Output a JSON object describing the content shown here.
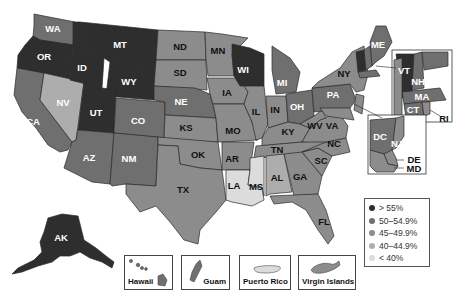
{
  "map": {
    "type": "choropleth",
    "region": "United States",
    "legend": {
      "items": [
        {
          "label": "> 55%",
          "color": "#2e2e2e"
        },
        {
          "label": "50–54.9%",
          "color": "#6f6f6f"
        },
        {
          "label": "45–49.9%",
          "color": "#8c8c8c"
        },
        {
          "label": "40–44.9%",
          "color": "#adadad"
        },
        {
          "label": "< 40%",
          "color": "#dcdcdc"
        }
      ]
    },
    "states": {
      "WA": {
        "label": "WA",
        "bin": "50–54.9%"
      },
      "OR": {
        "label": "OR",
        "bin": "> 55%"
      },
      "CA": {
        "label": "CA",
        "bin": "50–54.9%"
      },
      "NV": {
        "label": "NV",
        "bin": "40–44.9%"
      },
      "ID": {
        "label": "ID",
        "bin": "> 55%"
      },
      "MT": {
        "label": "MT",
        "bin": "> 55%"
      },
      "WY": {
        "label": "WY",
        "bin": "> 55%"
      },
      "UT": {
        "label": "UT",
        "bin": "> 55%"
      },
      "AZ": {
        "label": "AZ",
        "bin": "50–54.9%"
      },
      "CO": {
        "label": "CO",
        "bin": "50–54.9%"
      },
      "NM": {
        "label": "NM",
        "bin": "50–54.9%"
      },
      "ND": {
        "label": "ND",
        "bin": "45–49.9%"
      },
      "SD": {
        "label": "SD",
        "bin": "45–49.9%"
      },
      "NE": {
        "label": "NE",
        "bin": "50–54.9%"
      },
      "KS": {
        "label": "KS",
        "bin": "45–49.9%"
      },
      "OK": {
        "label": "OK",
        "bin": "45–49.9%"
      },
      "TX": {
        "label": "TX",
        "bin": "45–49.9%"
      },
      "MN": {
        "label": "MN",
        "bin": "45–49.9%"
      },
      "IA": {
        "label": "IA",
        "bin": "45–49.9%"
      },
      "MO": {
        "label": "MO",
        "bin": "45–49.9%"
      },
      "AR": {
        "label": "AR",
        "bin": "45–49.9%"
      },
      "LA": {
        "label": "LA",
        "bin": "< 40%"
      },
      "WI": {
        "label": "WI",
        "bin": "> 55%"
      },
      "IL": {
        "label": "IL",
        "bin": "45–49.9%"
      },
      "MI": {
        "label": "MI",
        "bin": "50–54.9%"
      },
      "IN": {
        "label": "IN",
        "bin": "45–49.9%"
      },
      "OH": {
        "label": "OH",
        "bin": "50–54.9%"
      },
      "KY": {
        "label": "KY",
        "bin": "45–49.9%"
      },
      "TN": {
        "label": "TN",
        "bin": "45–49.9%"
      },
      "MS": {
        "label": "MS",
        "bin": "< 40%"
      },
      "AL": {
        "label": "AL",
        "bin": "40–44.9%"
      },
      "GA": {
        "label": "GA",
        "bin": "45–49.9%"
      },
      "FL": {
        "label": "FL",
        "bin": "45–49.9%"
      },
      "SC": {
        "label": "SC",
        "bin": "45–49.9%"
      },
      "NC": {
        "label": "NC",
        "bin": "45–49.9%"
      },
      "VA": {
        "label": "VA",
        "bin": "45–49.9%"
      },
      "WV": {
        "label": "WV",
        "bin": "45–49.9%"
      },
      "PA": {
        "label": "PA",
        "bin": "50–54.9%"
      },
      "NY": {
        "label": "NY",
        "bin": "45–49.9%"
      },
      "VT": {
        "label": "VT",
        "bin": "> 55%"
      },
      "NH": {
        "label": "NH",
        "bin": "50–54.9%"
      },
      "ME": {
        "label": "ME",
        "bin": "50–54.9%"
      },
      "MA": {
        "label": "MA",
        "bin": "50–54.9%"
      },
      "CT": {
        "label": "CT",
        "bin": "50–54.9%"
      },
      "RI": {
        "label": "RI",
        "bin": "45–49.9%"
      },
      "NJ": {
        "label": "NJ",
        "bin": "45–49.9%"
      },
      "DE": {
        "label": "DE",
        "bin": "45–49.9%"
      },
      "MD": {
        "label": "MD",
        "bin": "45–49.9%"
      },
      "DC": {
        "label": "DC",
        "bin": "50–54.9%"
      },
      "AK": {
        "label": "AK",
        "bin": "> 55%"
      }
    },
    "insets": [
      {
        "label": "Hawaii",
        "bin": "50–54.9%"
      },
      {
        "label": "Guam",
        "bin": "50–54.9%"
      },
      {
        "label": "Puerto Rico",
        "bin": "< 40%"
      },
      {
        "label": "Virgin Islands",
        "bin": "45–49.9%"
      }
    ]
  }
}
